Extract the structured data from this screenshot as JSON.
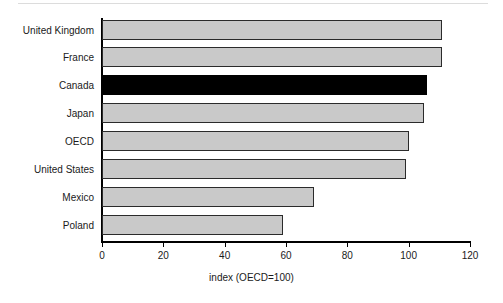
{
  "chart_data": {
    "type": "bar",
    "orientation": "horizontal",
    "title": "",
    "subtitle": "",
    "xlabel": "index (OECD=100)",
    "ylabel": "",
    "xlim": [
      0,
      120
    ],
    "xticks": [
      0,
      20,
      40,
      60,
      80,
      100,
      120
    ],
    "xtick_labels": [
      "0",
      "20",
      "40",
      "60",
      "80",
      "100",
      "120"
    ],
    "grid": false,
    "legend": null,
    "categories": [
      "United Kingdom",
      "France",
      "Canada",
      "Japan",
      "OECD",
      "United States",
      "Mexico",
      "Poland"
    ],
    "values": [
      111,
      111,
      106,
      105,
      100,
      99,
      69,
      59
    ],
    "highlight_category": "Canada",
    "colors": {
      "bar_fill": "#c9c9c9",
      "bar_edge": "#2b2b2b",
      "highlight_fill": "#000000",
      "axis": "#000000",
      "text": "#1a1a1a",
      "background": "#ffffff",
      "top_rule": "#dcdcdc"
    }
  }
}
